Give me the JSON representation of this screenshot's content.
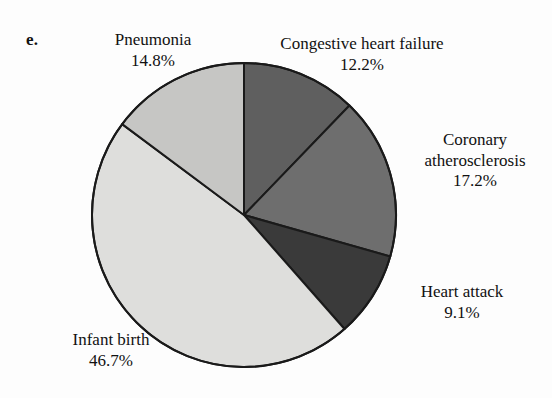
{
  "figure": {
    "panel_letter": "e."
  },
  "chart_data": {
    "type": "pie",
    "title": "",
    "subtitle": "",
    "xlabel": "",
    "ylabel": "",
    "legend_position": "none",
    "grid": false,
    "units": "percent",
    "start_angle_deg": 0,
    "direction": "clockwise",
    "total": "100.0%",
    "categories": [
      "Congestive heart failure",
      "Coronary atherosclerosis",
      "Heart attack",
      "Infant birth",
      "Pneumonia"
    ],
    "values": [
      12.2,
      17.2,
      9.1,
      46.7,
      14.8
    ],
    "slices": [
      {
        "label": "Congestive heart failure",
        "value": 12.2,
        "value_text": "12.2%",
        "color": "#5f5f5f"
      },
      {
        "label": "Coronary atherosclerosis",
        "value": 17.2,
        "value_text": "17.2%",
        "color": "#6e6e6e"
      },
      {
        "label": "Heart attack",
        "value": 9.1,
        "value_text": "9.1%",
        "color": "#3a3a3a"
      },
      {
        "label": "Infant birth",
        "value": 46.7,
        "value_text": "46.7%",
        "color": "#dededc"
      },
      {
        "label": "Pneumonia",
        "value": 14.8,
        "value_text": "14.8%",
        "color": "#c6c6c4"
      }
    ]
  },
  "labels": {
    "pneumonia": {
      "name": "Pneumonia",
      "value": "14.8%"
    },
    "congestive_heart_failure": {
      "name": "Congestive heart failure",
      "value": "12.2%"
    },
    "coronary_atherosclerosis": {
      "name_line1": "Coronary",
      "name_line2": "atherosclerosis",
      "value": "17.2%"
    },
    "heart_attack": {
      "name": "Heart attack",
      "value": "9.1%"
    },
    "infant_birth": {
      "name": "Infant birth",
      "value": "46.7%"
    }
  },
  "colors": {
    "background": "#fdfdfd",
    "outline": "#1a1a1a",
    "text": "#111111"
  }
}
